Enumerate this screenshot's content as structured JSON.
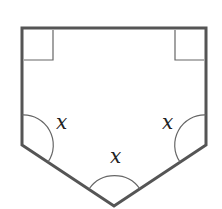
{
  "diagram": {
    "type": "pentagon",
    "stroke_color": "#555555",
    "angle_labels": {
      "left": "x",
      "right": "x",
      "bottom": "x"
    },
    "right_angle_markers": [
      "top-left",
      "top-right"
    ]
  }
}
